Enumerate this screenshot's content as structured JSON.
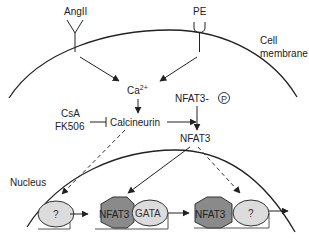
{
  "diagram": {
    "type": "signaling-pathway",
    "colors": {
      "line": "#222222",
      "nfat3_hexagon": "#8a8a8a",
      "ellipse_fill": "#dcdcdc",
      "background": "#ffffff"
    },
    "receptors": {
      "angII": "AngII",
      "pe": "PE"
    },
    "labels": {
      "cell_membrane_line1": "Cell",
      "cell_membrane_line2": "membrane",
      "nucleus": "Nucleus",
      "calcium_base": "Ca",
      "calcium_sup": "2+",
      "calcineurin": "Calcineurin",
      "inhibitor1": "CsA",
      "inhibitor2": "FK506",
      "nfat3_phospho": "NFAT3-",
      "phospho_symbol": "P",
      "nfat3": "NFAT3"
    },
    "nuclear_factors": [
      {
        "shape": "ellipse",
        "label": "?"
      },
      {
        "shape": "hexagon",
        "label": "NFAT3"
      },
      {
        "shape": "ellipse",
        "label": "GATA"
      },
      {
        "shape": "hexagon",
        "label": "NFAT3"
      },
      {
        "shape": "ellipse",
        "label": "?"
      }
    ],
    "edges": [
      {
        "from": "AngII",
        "to": "Ca2+",
        "style": "arrow"
      },
      {
        "from": "PE",
        "to": "Ca2+",
        "style": "arrow"
      },
      {
        "from": "Ca2+",
        "to": "Calcineurin",
        "style": "arrow"
      },
      {
        "from": "CsA/FK506",
        "to": "Calcineurin",
        "style": "inhibit"
      },
      {
        "from": "Calcineurin",
        "to": "NFAT3-P dephosphorylation",
        "style": "arrow"
      },
      {
        "from": "NFAT3-P",
        "to": "NFAT3",
        "style": "arrow"
      },
      {
        "from": "Calcineurin",
        "to": "? (factor 1)",
        "style": "dashed-arrow"
      },
      {
        "from": "NFAT3",
        "to": "NFAT3 (with GATA)",
        "style": "arrow"
      },
      {
        "from": "NFAT3",
        "to": "? (factor 2)",
        "style": "dashed-arrow"
      }
    ]
  }
}
